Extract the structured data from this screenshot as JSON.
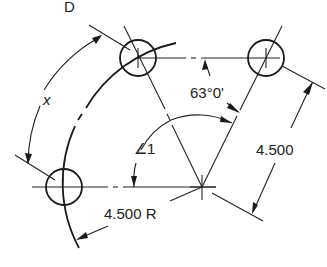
{
  "figure": {
    "label": "D",
    "dimensions": {
      "angle_between": "63°0'",
      "unknown_angle": "∠1",
      "chord_distance": "4.500",
      "radius": "4.500 R",
      "arc_length": "x"
    },
    "colors": {
      "line": "#222222",
      "background": "#ffffff"
    }
  }
}
